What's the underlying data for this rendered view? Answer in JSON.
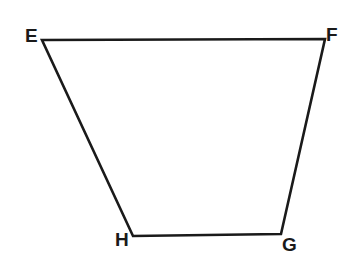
{
  "figure": {
    "kind": "quadrilateral-trapezoid",
    "name": "EFGH",
    "stroke_color": "#1a1a1a",
    "fill_color": "#ffffff",
    "background_color": "#ffffff",
    "stroke_width": 2.6,
    "vertices": [
      {
        "label": "E",
        "x": 42,
        "y": 40,
        "label_x": 25,
        "label_y": 26
      },
      {
        "label": "F",
        "x": 325,
        "y": 39,
        "label_x": 326,
        "label_y": 25
      },
      {
        "label": "G",
        "x": 281,
        "y": 234,
        "label_x": 282,
        "label_y": 235
      },
      {
        "label": "H",
        "x": 133,
        "y": 236,
        "label_x": 115,
        "label_y": 230
      }
    ],
    "edges": [
      {
        "name": "EF",
        "from": "E",
        "to": "F"
      },
      {
        "name": "FG",
        "from": "F",
        "to": "G"
      },
      {
        "name": "GH",
        "from": "G",
        "to": "H"
      },
      {
        "name": "HE",
        "from": "H",
        "to": "E"
      }
    ],
    "path": "M 42 40 L 325 39 L 281 234 L 133 236 Z"
  },
  "labels": {
    "E": "E",
    "F": "F",
    "G": "G",
    "H": "H"
  }
}
